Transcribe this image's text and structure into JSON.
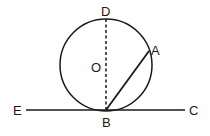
{
  "diagram": {
    "type": "geometry",
    "labels": {
      "D": "D",
      "O": "O",
      "A": "A",
      "B": "B",
      "E": "E",
      "C": "C"
    },
    "colors": {
      "stroke": "#1a1a1a",
      "background": "#ffffff"
    }
  }
}
